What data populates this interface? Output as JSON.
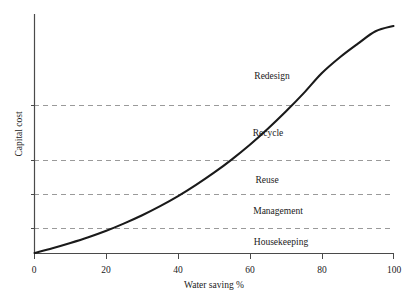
{
  "chart_data": {
    "type": "line",
    "title": "",
    "xlabel": "Water saving %",
    "ylabel": "Capital cost",
    "xlim": [
      0,
      100
    ],
    "ylim": [
      0,
      100
    ],
    "grid": "horizontal-dashed",
    "legend": "none",
    "x_ticks": [
      {
        "value": 0,
        "label": "0"
      },
      {
        "value": 20,
        "label": "20"
      },
      {
        "value": 40,
        "label": "40"
      },
      {
        "value": 60,
        "label": "60"
      },
      {
        "value": 80,
        "label": "80"
      },
      {
        "value": 100,
        "label": "100"
      }
    ],
    "y_ticks": [
      {
        "value": 0,
        "label": ""
      },
      {
        "value": 10.5,
        "label": ""
      },
      {
        "value": 24.7,
        "label": ""
      },
      {
        "value": 38.9,
        "label": ""
      },
      {
        "value": 61.9,
        "label": ""
      }
    ],
    "gridlines_y": [
      10.5,
      24.7,
      38.9,
      61.9
    ],
    "series": [
      {
        "name": "Capital cost curve",
        "color": "#1a1a1a",
        "x": [
          0,
          5,
          10,
          15,
          20,
          25,
          30,
          35,
          40,
          45,
          50,
          55,
          60,
          65,
          70,
          75,
          80,
          85,
          90,
          95,
          100
        ],
        "y": [
          0,
          2.0,
          4.2,
          6.6,
          9.3,
          12.4,
          15.8,
          19.6,
          23.8,
          28.5,
          33.6,
          39.2,
          45.3,
          52.0,
          59.2,
          66.9,
          75.2,
          81.8,
          87.5,
          92.8,
          95.0
        ]
      }
    ],
    "band_labels": [
      {
        "text": "Redesign",
        "x": 62,
        "y": 76
      },
      {
        "text": "Recycle",
        "x": 62,
        "y": 52
      },
      {
        "text": "Reuse",
        "x": 62,
        "y": 31
      },
      {
        "text": "Management",
        "x": 62,
        "y": 18
      },
      {
        "text": "Housekeeping",
        "x": 62,
        "y": 5
      }
    ]
  },
  "axes": {
    "x_title": "Water saving %",
    "y_title": "Capital cost"
  },
  "ticks": {
    "x": [
      "0",
      "20",
      "40",
      "60",
      "80",
      "100"
    ]
  },
  "bands": [
    {
      "label": "Redesign"
    },
    {
      "label": "Recycle"
    },
    {
      "label": "Reuse"
    },
    {
      "label": "Management"
    },
    {
      "label": "Housekeeping"
    }
  ],
  "colors": {
    "curve": "#1a1a1a",
    "axis": "#4a4a4a",
    "grid": "#9a9a9a",
    "background": "#ffffff",
    "text": "#1a1a1a"
  }
}
